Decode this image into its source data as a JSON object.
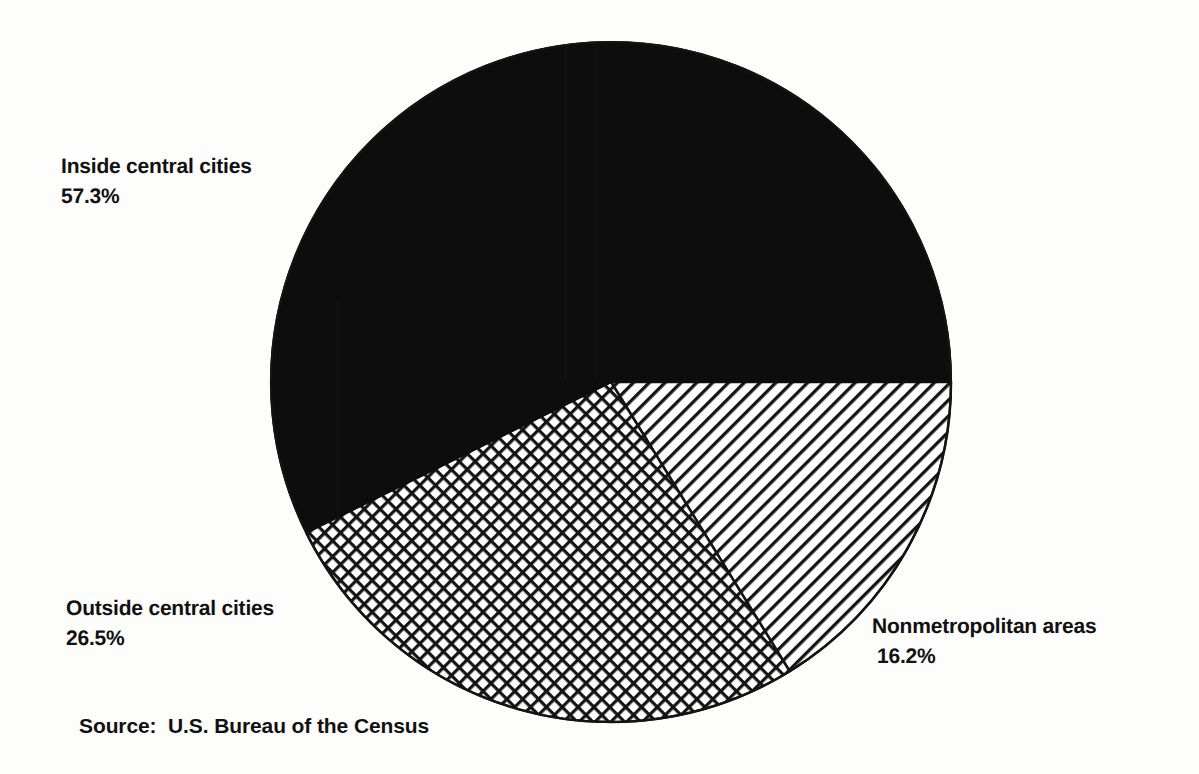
{
  "figure": {
    "background_color": "#fdfdfc",
    "ink_color": "#111111",
    "source_note": "Source:  U.S. Bureau of the Census"
  },
  "geometry": {
    "center_x": 611,
    "center_y": 382,
    "radius": 340
  },
  "labels": {
    "inside": {
      "name": "Inside central cities",
      "value": "57.3%"
    },
    "outside": {
      "name": "Outside central cities",
      "value": "26.5%"
    },
    "nonmetro": {
      "name": "Nonmetropolitan areas",
      "value": "16.2%"
    }
  },
  "chart_data": {
    "type": "pie",
    "title": "",
    "subtitle": "",
    "xlabel": "",
    "ylabel": "",
    "grid": false,
    "legend_position": "none",
    "labels_position": "outside-callout",
    "units": "percent",
    "start_angle_deg": 0,
    "direction": "counterclockwise",
    "source": "Source:  U.S. Bureau of the Census",
    "categories": [
      "Inside central cities",
      "Outside central cities",
      "Nonmetropolitan areas"
    ],
    "values": [
      57.3,
      26.5,
      16.2
    ],
    "slices": [
      {
        "label": "Inside central cities",
        "value": 57.3,
        "value_text": "57.3%",
        "fill": "solid-black",
        "fill_color": "#0d0d0d",
        "start_deg": 0,
        "sweep_deg": 206.3
      },
      {
        "label": "Outside central cities",
        "value": 26.5,
        "value_text": "26.5%",
        "fill": "crosshatch",
        "fill_color": "#ffffff",
        "start_deg": 206.3,
        "sweep_deg": 95.4
      },
      {
        "label": "Nonmetropolitan areas",
        "value": 16.2,
        "value_text": "16.2%",
        "fill": "diagonal-stripes",
        "fill_color": "#ffffff",
        "start_deg": 301.7,
        "sweep_deg": 58.3
      }
    ],
    "total": 100.0
  }
}
